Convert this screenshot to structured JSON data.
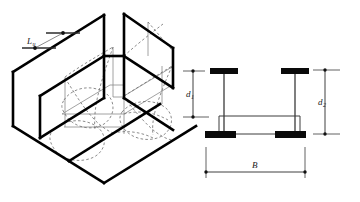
{
  "figure": {
    "background_color": "#ffffff",
    "width": 360,
    "height": 202
  },
  "isometric_view": {
    "name": "channel-beam-isometric",
    "description": "Isometric view of a double-channel beam segment showing lateral-torsional buckling deformation",
    "unbraced_length_label": {
      "symbol": "L",
      "subscript": "u",
      "full": "Lu"
    },
    "line_colors": {
      "outline_heavy": "#000000",
      "outline_light": "#8a8a8a",
      "hidden_dashed": "#6e6e6e",
      "leader": "#7d7d7d"
    }
  },
  "cross_section": {
    "name": "beam-cross-section",
    "description": "Cross-section of built-up section with top and bottom flanges and two webs",
    "dimensions": [
      {
        "key": "d1",
        "symbol": "d",
        "subscript": "1",
        "full": "d1",
        "orientation": "vertical",
        "position": "left",
        "meaning": "inner depth"
      },
      {
        "key": "d2",
        "symbol": "d",
        "subscript": "2",
        "full": "d2",
        "orientation": "vertical",
        "position": "right",
        "meaning": "overall depth"
      },
      {
        "key": "B",
        "symbol": "B",
        "subscript": "",
        "full": "B",
        "orientation": "horizontal",
        "position": "bottom",
        "meaning": "overall width"
      }
    ],
    "colors": {
      "flange_fill": "#0a0a0a",
      "web_stroke": "#555555",
      "plate_stroke": "#3c3c3c",
      "dimension_stroke": "#2b2b2b"
    }
  }
}
